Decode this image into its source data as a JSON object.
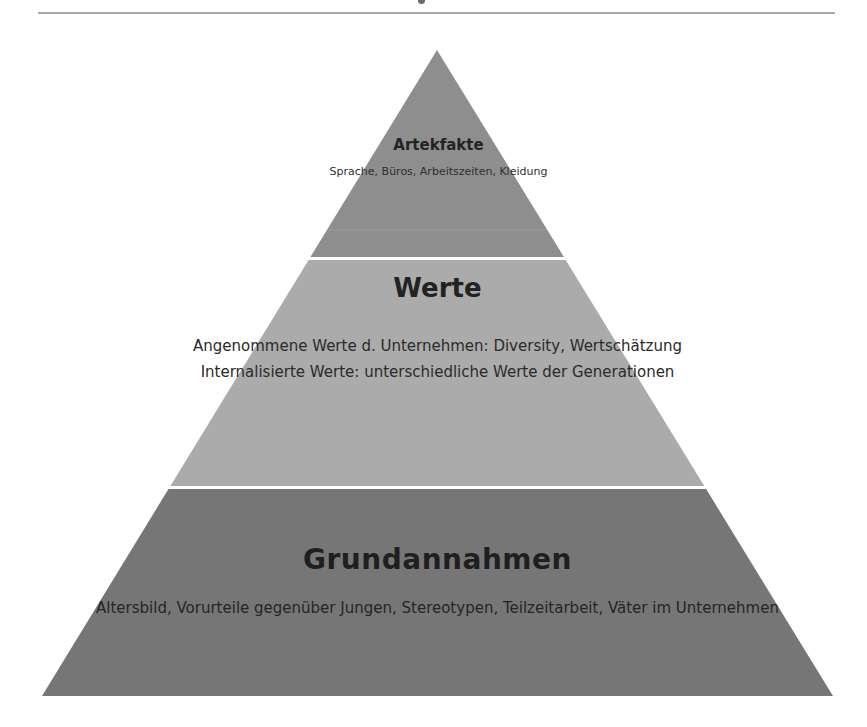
{
  "colors": {
    "top_tier": "#8e8e8e",
    "middle_tier": "#ababab",
    "bottom_tier": "#767676",
    "separator": "#ffffff",
    "text": "#2a2a2a",
    "header_rule": "#a8a8a8"
  },
  "pyramid": {
    "tiers": [
      {
        "title": "Artekfakte",
        "lines": [
          "Sprache,",
          "Büros, Arbeitszeiten,",
          "Kleidung"
        ]
      },
      {
        "title": "Werte",
        "paragraphs": [
          [
            "Angenommene Werte d.",
            "Unternehmen: Diversity,",
            "Wertschätzung"
          ],
          [
            "Internalisierte Werte:",
            "unterschiedliche Werte der",
            "Generationen"
          ]
        ]
      },
      {
        "title": "Grundannahmen",
        "lines": [
          "Altersbild, Vorurteile gegenüber Jungen,",
          "Stereotypen, Teilzeitarbeit, Väter im Unternehmen"
        ]
      }
    ]
  }
}
